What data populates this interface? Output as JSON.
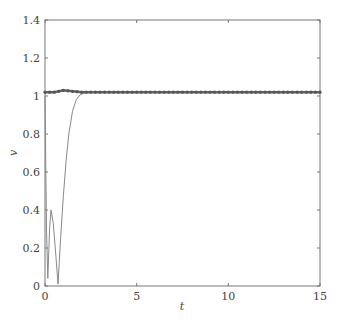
{
  "chart_data": {
    "type": "line",
    "title": "",
    "xlabel": "t",
    "ylabel": "v",
    "xlim": [
      0,
      15
    ],
    "ylim": [
      0,
      1.4
    ],
    "xticks": [
      0,
      5,
      10,
      15
    ],
    "xtick_labels": [
      "0",
      "5",
      "10",
      "15"
    ],
    "yticks": [
      0,
      0.2,
      0.4,
      0.6,
      0.8,
      1.0,
      1.2,
      1.4
    ],
    "ytick_labels": [
      "0",
      "0.2",
      "0.4",
      "0.6",
      "0.8",
      "1",
      "1.2",
      "1.4"
    ],
    "grid": false,
    "legend": null,
    "series": [
      {
        "name": "marker series",
        "style": "thick line with dense dot markers",
        "color": "#666666",
        "x": [
          0,
          0.5,
          1.0,
          1.5,
          2.0,
          3,
          4,
          5,
          6,
          7,
          8,
          9,
          10,
          11,
          12,
          13,
          14,
          15
        ],
        "y": [
          1.02,
          1.02,
          1.03,
          1.025,
          1.02,
          1.02,
          1.02,
          1.02,
          1.02,
          1.02,
          1.02,
          1.02,
          1.02,
          1.02,
          1.02,
          1.02,
          1.02,
          1.02
        ]
      },
      {
        "name": "thin series",
        "style": "thin solid line",
        "color": "#888888",
        "x": [
          0,
          0.08,
          0.15,
          0.25,
          0.33,
          0.45,
          0.6,
          0.71,
          0.85,
          1.0,
          1.15,
          1.3,
          1.5,
          1.7,
          1.9,
          2.1,
          2.3,
          3,
          5,
          10,
          15
        ],
        "y": [
          1.0,
          0.3,
          0.04,
          0.3,
          0.4,
          0.33,
          0.15,
          0.01,
          0.25,
          0.47,
          0.66,
          0.8,
          0.92,
          0.98,
          1.005,
          1.015,
          1.02,
          1.02,
          1.02,
          1.02,
          1.02
        ]
      }
    ]
  }
}
